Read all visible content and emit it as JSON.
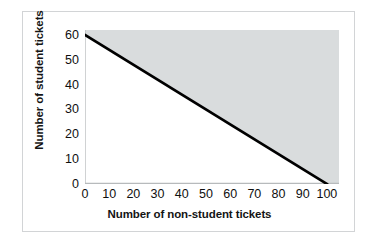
{
  "chart_data": {
    "type": "line",
    "title": "",
    "xlabel": "Number of non-student tickets",
    "ylabel": "Number of student tickets",
    "xlim": [
      0,
      105
    ],
    "ylim": [
      0,
      62
    ],
    "xticks": [
      0,
      10,
      20,
      30,
      40,
      50,
      60,
      70,
      80,
      90,
      100
    ],
    "xticklabels": [
      "0",
      "10",
      "20",
      "30",
      "40",
      "50",
      "60",
      "70",
      "80",
      "90",
      "100"
    ],
    "yticks": [
      0,
      10,
      20,
      30,
      40,
      50,
      60
    ],
    "yticklabels": [
      "0",
      "10",
      "20",
      "30",
      "40",
      "50",
      "60"
    ],
    "grid": false,
    "legend": null,
    "series": [
      {
        "name": "constraint-line",
        "x": [
          0,
          100
        ],
        "values": [
          60,
          0
        ],
        "color": "#000000",
        "linewidth": 2.6
      }
    ],
    "shaded_region": {
      "name": "region-above-line",
      "description": "Shaded area above the line",
      "color": "#d9dcdd",
      "polygon_x": [
        0,
        100,
        105,
        105,
        0
      ],
      "polygon_y": [
        60,
        0,
        0,
        62,
        62
      ]
    },
    "colors": {
      "line": "#000000",
      "shading": "#d9dcdd",
      "axis": "#b7babc",
      "frame": "#d2d4d6",
      "text": "#0f0f0f",
      "background": "#ffffff"
    }
  }
}
